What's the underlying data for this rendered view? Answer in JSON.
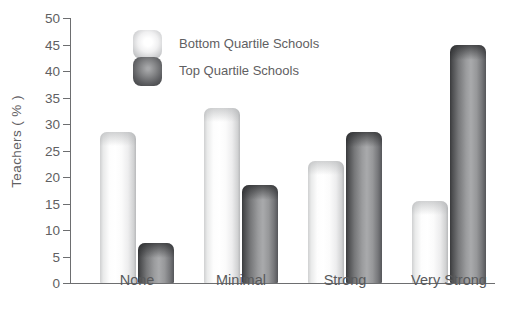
{
  "chart_data": {
    "type": "bar",
    "title": "",
    "xlabel": "",
    "ylabel": "Teachers ( % )",
    "categories": [
      "None",
      "Minimal",
      "Strong",
      "Very Strong"
    ],
    "series": [
      {
        "name": "Bottom Quartile Schools",
        "values": [
          28.5,
          33,
          23,
          15.5
        ],
        "color": "#f2f2f2"
      },
      {
        "name": "Top Quartile Schools",
        "values": [
          7.5,
          18.5,
          28.5,
          45
        ],
        "color": "#6d6e70"
      }
    ],
    "ylim": [
      0,
      50
    ],
    "ytick_step": 5,
    "yticks": [
      0,
      5,
      10,
      15,
      20,
      25,
      30,
      35,
      40,
      45,
      50
    ],
    "ytick_labels": [
      "0",
      "5",
      "10",
      "15",
      "20",
      "25",
      "30",
      "35",
      "40",
      "45",
      "50"
    ],
    "grid": false,
    "legend_position": "upper-left-inside"
  }
}
